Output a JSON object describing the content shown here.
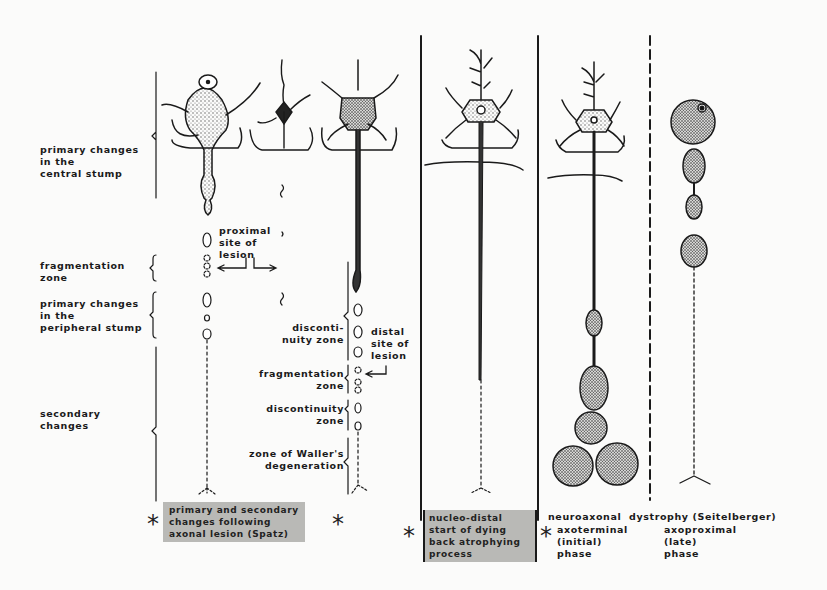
{
  "figure": {
    "type": "neuron degeneration diagram",
    "left_labels": [
      {
        "id": "central",
        "text": "primary changes\nin the\ncentral stump"
      },
      {
        "id": "frag",
        "text": "fragmentation\nzone"
      },
      {
        "id": "peripheral",
        "text": "primary changes\nin the\nperipheral stump"
      },
      {
        "id": "secondary",
        "text": "secondary\nchanges"
      }
    ],
    "inner_labels": {
      "proximal": "proximal\nsite of\nlesion",
      "discontinuity1": "disconti-\nnuity zone",
      "distal": "distal\nsite of\nlesion",
      "fragmentation2": "fragmentation\nzone",
      "discontinuity2": "discontinuity\nzone",
      "waller": "zone of Waller's\ndegeneration"
    },
    "captions": {
      "spatz": "primary and secondary\nchanges following\naxonal lesion (Spatz)",
      "dying_back": "nucleo-distal\nstart of dying\nback atrophying\nprocess",
      "dystrophy_title": "neuroaxonal  dystrophy (Seitelberger)",
      "axoterminal": "axoterminal\n(initial)\nphase",
      "axoproximal": "axoproximal\n(late)\nphase"
    },
    "markers": {
      "asterisk": "*"
    },
    "colors": {
      "ink": "#1a1a1a",
      "caption_bg": "#b9b9b6",
      "paper": "#fbfbfa"
    }
  }
}
